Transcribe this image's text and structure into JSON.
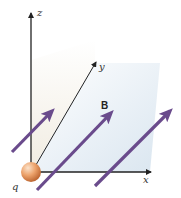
{
  "diagram": {
    "axes": {
      "x_label": "x",
      "y_label": "y",
      "z_label": "z"
    },
    "field_label": "B",
    "charge_label": "q",
    "colors": {
      "field_arrow": "#6a4b8c",
      "charge_fill": "#e8a06a",
      "charge_highlight": "#fbe3cc",
      "axis": "#222222",
      "plane_left": "#f3efe6",
      "plane_right": "#dde8f1"
    },
    "field_arrow_count": 3
  }
}
